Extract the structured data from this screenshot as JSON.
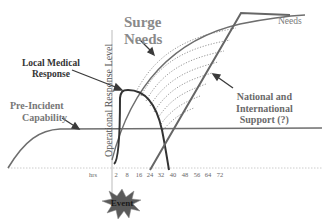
{
  "diagram": {
    "title": "Surge Needs",
    "y_axis_label": "Operational Response Level",
    "x_axis_unit": "hrs",
    "x_ticks": [
      "2",
      "8",
      "16",
      "24",
      "32",
      "40",
      "48",
      "56",
      "64",
      "72"
    ],
    "labels": {
      "surge_needs": "Surge\nNeeds",
      "surge_line1": "Surge",
      "surge_line2": "Needs",
      "local_line1": "Local Medical",
      "local_line2": "Response",
      "pre_line1": "Pre-Incident",
      "pre_line2": "Capability",
      "natl_line1": "National and",
      "natl_line2": "International",
      "natl_line3": "Support (?)",
      "needs": "Needs",
      "event": "Event"
    },
    "curves": [
      {
        "name": "Pre-Incident Capability",
        "description": "S-curve rising then flat horizontal line"
      },
      {
        "name": "Surge Needs",
        "description": "concave curve rising from event to top right"
      },
      {
        "name": "Local Medical Response",
        "description": "rapid rise at ~8 hrs then decline to ~40 hrs"
      },
      {
        "name": "National and International Support (?)",
        "description": "straight line rising from ~32 hrs to meet Needs"
      },
      {
        "name": "Unmet needs gap",
        "description": "dotted arcs between local response and surge needs"
      }
    ],
    "colors": {
      "line_dark": "#3a3a3a",
      "line_mid": "#6e6e6e",
      "dotted": "#8c8c8c",
      "axis": "#aaaaaa",
      "event_star": "#555555"
    }
  }
}
